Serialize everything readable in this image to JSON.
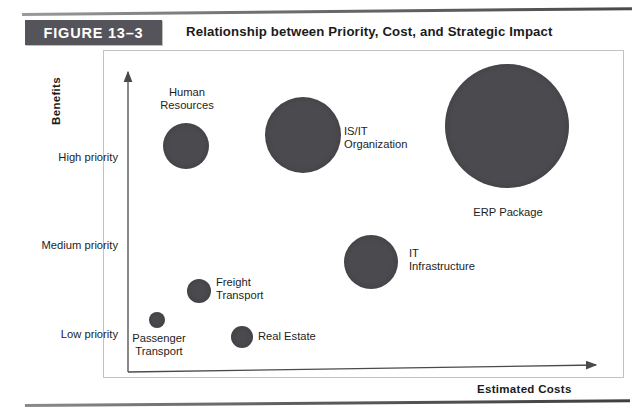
{
  "figure": {
    "badge": "FIGURE 13–3",
    "title": "Relationship between Priority, Cost, and Strategic Impact"
  },
  "chart_data": {
    "type": "scatter",
    "title": "Relationship between Priority, Cost, and Strategic Impact",
    "xlabel": "Estimated Costs",
    "ylabel": "Benefits",
    "grid": false,
    "legend": "none",
    "y_tick_labels": [
      "High priority",
      "Medium priority",
      "Low priority"
    ],
    "x_tick_labels": [],
    "note": "Bubble area encodes relative project size; x = estimated costs, y = benefits/priority",
    "points": [
      {
        "label": "Human Resources",
        "priority": "High priority",
        "cost_rank": 2,
        "size_rank": 4,
        "cx": 186,
        "cy": 146,
        "r": 23,
        "label_x": 155,
        "label_y": 86,
        "label_w": 64,
        "label_align": "center"
      },
      {
        "label": "IS/IT Organization",
        "priority": "High priority",
        "cost_rank": 4,
        "size_rank": 5,
        "cx": 303,
        "cy": 135,
        "r": 38,
        "label_x": 344,
        "label_y": 125,
        "label_w": 80,
        "label_align": "left"
      },
      {
        "label": "ERP Package",
        "priority": "High priority",
        "cost_rank": 6,
        "size_rank": 6,
        "cx": 507,
        "cy": 126,
        "r": 62,
        "label_x": 462,
        "label_y": 206,
        "label_w": 92,
        "label_align": "center"
      },
      {
        "label": "IT Infrastructure",
        "priority": "Medium priority",
        "cost_rank": 5,
        "size_rank": 3,
        "cx": 371,
        "cy": 262,
        "r": 27,
        "label_x": 409,
        "label_y": 247,
        "label_w": 76,
        "label_align": "left"
      },
      {
        "label": "Freight Transport",
        "priority": "Low priority",
        "cost_rank": 3,
        "size_rank": 2,
        "cx": 199,
        "cy": 291,
        "r": 12,
        "label_x": 216,
        "label_y": 276,
        "label_w": 68,
        "label_align": "left"
      },
      {
        "label": "Passenger Transport",
        "priority": "Low priority",
        "cost_rank": 1,
        "size_rank": 1,
        "cx": 157,
        "cy": 320,
        "r": 8,
        "label_x": 121,
        "label_y": 332,
        "label_w": 76,
        "label_align": "center"
      },
      {
        "label": "Real Estate",
        "priority": "Low priority",
        "cost_rank": 3,
        "size_rank": 2,
        "cx": 242,
        "cy": 337,
        "r": 11,
        "label_x": 258,
        "label_y": 330,
        "label_w": 70,
        "label_align": "left"
      }
    ]
  },
  "colors": {
    "bubble_fill": "#4b4a4e",
    "badge_bg": "#55545a",
    "axis_line": "#4a4a4a",
    "text": "#1d1d1d",
    "frame_border": "#c2c2c2"
  }
}
